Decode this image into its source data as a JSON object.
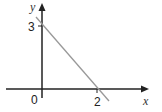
{
  "diagram": {
    "type": "coordinate-graph",
    "axes": {
      "x_label": "x",
      "y_label": "y",
      "origin_label": "0"
    },
    "line": {
      "y_intercept": 3,
      "x_intercept": 2,
      "y_intercept_label": "3",
      "x_intercept_label": "2",
      "color": "#999999"
    },
    "axis_color": "#222222"
  }
}
